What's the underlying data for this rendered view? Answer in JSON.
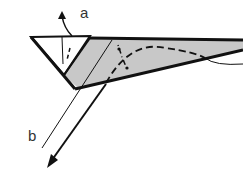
{
  "diagram": {
    "type": "origami-fold-step",
    "labels": {
      "a": "a",
      "b": "b"
    },
    "colors": {
      "paper_shade": "#c8c8c8",
      "line": "#111111",
      "background": "#ffffff"
    },
    "annotations": [
      {
        "id": "a",
        "description": "arrow indicating small flap lifted upward"
      },
      {
        "id": "b",
        "description": "arrow indicating fold pulled down-left along line"
      }
    ]
  }
}
